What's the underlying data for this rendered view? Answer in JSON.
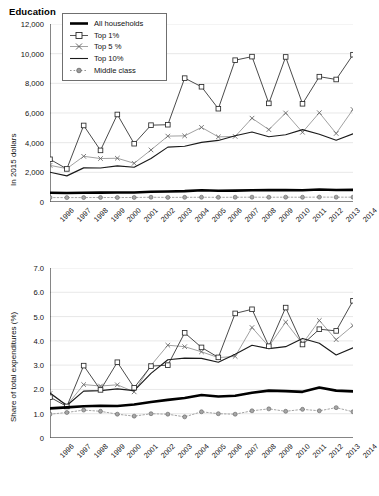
{
  "figure": {
    "title": "Education"
  },
  "legend": {
    "items": [
      {
        "label": "All households",
        "key": "thick-line",
        "color": "#000000"
      },
      {
        "label": "Top 1%",
        "key": "line-square-marker",
        "color": "#2b2b2b"
      },
      {
        "label": "Top 5 %",
        "key": "line-x-marker",
        "color": "#8a8a8a"
      },
      {
        "label": "Top 10%",
        "key": "thin-line",
        "color": "#1a1a1a"
      },
      {
        "label": "Middle class",
        "key": "dotted-circle-marker",
        "color": "#8a8a8a"
      }
    ]
  },
  "chart_data": [
    {
      "type": "line",
      "panel": "top",
      "title": "Education",
      "xlabel": "",
      "ylabel": "In 2015 dollars",
      "x": [
        1996,
        1997,
        1998,
        1999,
        2000,
        2001,
        2002,
        2003,
        2004,
        2005,
        2006,
        2007,
        2008,
        2009,
        2010,
        2011,
        2012,
        2013,
        2014
      ],
      "xlim": [
        1996,
        2014
      ],
      "ylim": [
        0,
        12000
      ],
      "yticks": [
        0,
        2000,
        4000,
        6000,
        8000,
        10000,
        12000
      ],
      "ytick_labels": [
        "0",
        "2,000",
        "4,000",
        "6,000",
        "8,000",
        "10,000",
        "12,000"
      ],
      "grid": true,
      "legend_position": "upper-left-inside",
      "series": [
        {
          "name": "All households",
          "values": [
            620,
            610,
            620,
            630,
            640,
            640,
            690,
            710,
            730,
            790,
            760,
            770,
            790,
            810,
            800,
            790,
            840,
            810,
            820
          ]
        },
        {
          "name": "Top 1%",
          "values": [
            2880,
            2230,
            5160,
            3480,
            5900,
            3930,
            5180,
            5210,
            8350,
            7770,
            6290,
            9560,
            9800,
            6650,
            9780,
            6620,
            8450,
            8260,
            9930
          ]
        },
        {
          "name": "Top 5 %",
          "values": [
            2470,
            2250,
            3080,
            2930,
            2950,
            2610,
            3510,
            4440,
            4460,
            5030,
            4390,
            4420,
            5650,
            4880,
            6000,
            4700,
            6020,
            4620,
            6240
          ]
        },
        {
          "name": "Top 10%",
          "values": [
            2010,
            1760,
            2300,
            2290,
            2440,
            2340,
            2930,
            3700,
            3760,
            4020,
            4150,
            4470,
            4720,
            4400,
            4530,
            4880,
            4570,
            4160,
            4600
          ]
        },
        {
          "name": "Middle class",
          "values": [
            300,
            295,
            300,
            305,
            300,
            305,
            320,
            310,
            315,
            320,
            315,
            320,
            325,
            320,
            325,
            320,
            330,
            325,
            325
          ]
        }
      ]
    },
    {
      "type": "line",
      "panel": "bottom",
      "title": "",
      "xlabel": "",
      "ylabel": "Share of total expenditures (%)",
      "x": [
        1996,
        1997,
        1998,
        1999,
        2000,
        2001,
        2002,
        2003,
        2004,
        2005,
        2006,
        2007,
        2008,
        2009,
        2010,
        2011,
        2012,
        2013,
        2014
      ],
      "xlim": [
        1996,
        2014
      ],
      "ylim": [
        0,
        7.0
      ],
      "yticks": [
        0,
        1.0,
        2.0,
        3.0,
        4.0,
        5.0,
        6.0,
        7.0
      ],
      "ytick_labels": [
        "0",
        "1.0",
        "2.0",
        "3.0",
        "4.0",
        "5.0",
        "6.0",
        "7.0"
      ],
      "grid": true,
      "legend_position": "none",
      "series": [
        {
          "name": "All households",
          "values": [
            1.22,
            1.26,
            1.31,
            1.33,
            1.32,
            1.38,
            1.48,
            1.57,
            1.65,
            1.77,
            1.71,
            1.74,
            1.86,
            1.95,
            1.93,
            1.9,
            2.08,
            1.95,
            1.92
          ]
        },
        {
          "name": "Top 1%",
          "values": [
            1.68,
            1.3,
            2.98,
            1.98,
            3.12,
            2.07,
            2.96,
            3.0,
            4.33,
            3.73,
            3.32,
            5.13,
            5.3,
            3.78,
            5.37,
            3.85,
            4.48,
            4.41,
            5.65
          ]
        },
        {
          "name": "Top 5 %",
          "values": [
            1.83,
            1.34,
            2.2,
            2.14,
            2.19,
            1.9,
            2.99,
            3.82,
            3.76,
            3.55,
            3.31,
            3.36,
            4.55,
            3.77,
            4.77,
            3.88,
            4.84,
            4.05,
            4.63
          ]
        },
        {
          "name": "Top 10%",
          "values": [
            1.85,
            1.34,
            1.93,
            1.95,
            2.02,
            1.95,
            2.66,
            3.22,
            3.29,
            3.28,
            3.12,
            3.45,
            3.82,
            3.68,
            3.76,
            4.1,
            3.9,
            3.42,
            3.71
          ]
        },
        {
          "name": "Middle class",
          "values": [
            0.98,
            1.05,
            1.15,
            1.1,
            0.98,
            0.9,
            1.0,
            0.98,
            0.87,
            1.08,
            1.0,
            0.98,
            1.12,
            1.2,
            1.1,
            1.18,
            1.12,
            1.25,
            1.08
          ]
        }
      ]
    }
  ],
  "xtick_labels": [
    "1996",
    "1997",
    "1998",
    "1999",
    "2000",
    "2001",
    "2002",
    "2003",
    "2004",
    "2005",
    "2006",
    "2007",
    "2008",
    "2009",
    "2010",
    "2011",
    "2012",
    "2013",
    "2014"
  ]
}
